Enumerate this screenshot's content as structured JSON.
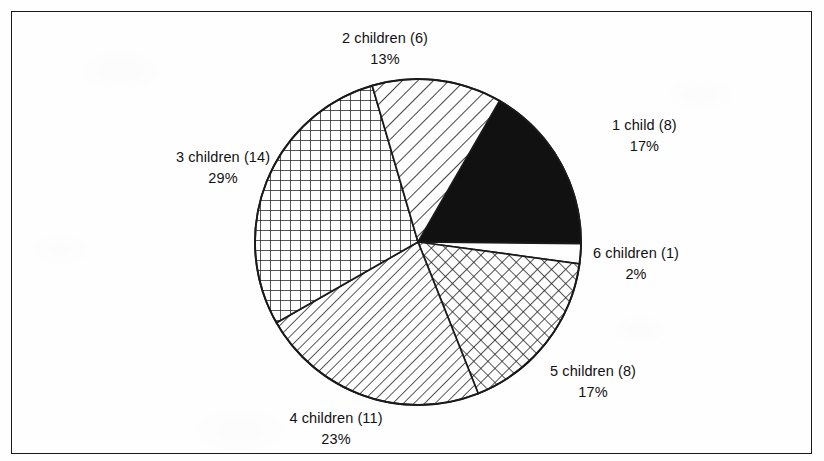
{
  "figure": {
    "background_color": "#fefefe",
    "border_color": "#1a1a1a",
    "text_color": "#111111"
  },
  "chart_data": {
    "type": "pie",
    "title": "",
    "subtitle": "",
    "xlabel": "",
    "ylabel": "",
    "grid": false,
    "legend": "none",
    "label_format": "{category} ({count})\\n{percent}%",
    "total_count": 48,
    "start_angle_deg": -60,
    "direction": "clockwise",
    "center": {
      "x": 418,
      "y": 242
    },
    "radius": 163,
    "categories": [
      "1 child",
      "6 children",
      "5 children",
      "4 children",
      "3 children",
      "2 children"
    ],
    "counts": [
      8,
      1,
      8,
      11,
      14,
      6
    ],
    "values": [
      17,
      2,
      17,
      23,
      29,
      13
    ],
    "slices": [
      {
        "category": "1 child",
        "count": 8,
        "percent": 17,
        "label_line1": "1 child (8)",
        "label_line2": "17%",
        "fill": "solid-black",
        "fill_color": "#111111"
      },
      {
        "category": "6 children",
        "count": 1,
        "percent": 2,
        "label_line1": "6 children (1)",
        "label_line2": "2%",
        "fill": "blank-white",
        "fill_color": "#ffffff"
      },
      {
        "category": "5 children",
        "count": 8,
        "percent": 17,
        "label_line1": "5 children (8)",
        "label_line2": "17%",
        "fill": "diagonal-crosshatch",
        "fill_color": "#ffffff"
      },
      {
        "category": "4 children",
        "count": 11,
        "percent": 23,
        "label_line1": "4 children (11)",
        "label_line2": "23%",
        "fill": "diagonal-lines-backslash-fine",
        "fill_color": "#ffffff"
      },
      {
        "category": "3 children",
        "count": 14,
        "percent": 29,
        "label_line1": "3 children (14)",
        "label_line2": "29%",
        "fill": "square-grid",
        "fill_color": "#ffffff"
      },
      {
        "category": "2 children",
        "count": 6,
        "percent": 13,
        "label_line1": "2 children (6)",
        "label_line2": "13%",
        "fill": "diagonal-lines-backslash-wide",
        "fill_color": "#ffffff"
      }
    ]
  }
}
